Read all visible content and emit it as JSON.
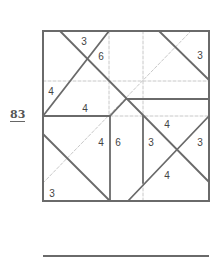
{
  "puzzle": {
    "number": "83",
    "frame": {
      "x1": 43,
      "y1": 31,
      "x2": 209,
      "y2": 201
    },
    "colors": {
      "solid": "#6a6a6a",
      "dashed": "#c8c8c8",
      "label": "#444444"
    },
    "solid_lines": [
      [
        60,
        31,
        209,
        182
      ],
      [
        109,
        31,
        43,
        116
      ],
      [
        159,
        31,
        209,
        80
      ],
      [
        126,
        99,
        209,
        99
      ],
      [
        43,
        116,
        110,
        116
      ],
      [
        110,
        116,
        126,
        99
      ],
      [
        110,
        116,
        110,
        201
      ],
      [
        143,
        116,
        143,
        183
      ],
      [
        128,
        201,
        209,
        116
      ],
      [
        43,
        134,
        110,
        201
      ]
    ],
    "dashed_lines": [
      [
        109,
        31,
        109,
        116
      ],
      [
        143,
        31,
        143,
        116
      ],
      [
        143,
        183,
        143,
        201
      ],
      [
        43,
        81,
        209,
        81
      ],
      [
        110,
        116,
        209,
        116
      ],
      [
        43,
        183,
        191,
        31
      ]
    ],
    "labels": [
      {
        "text": "3",
        "x": 84,
        "y": 45
      },
      {
        "text": "6",
        "x": 101,
        "y": 60
      },
      {
        "text": "3",
        "x": 200,
        "y": 59
      },
      {
        "text": "4",
        "x": 51,
        "y": 95
      },
      {
        "text": "4",
        "x": 85,
        "y": 112
      },
      {
        "text": "4",
        "x": 167,
        "y": 128
      },
      {
        "text": "4",
        "x": 101,
        "y": 146
      },
      {
        "text": "6",
        "x": 118,
        "y": 146
      },
      {
        "text": "3",
        "x": 151,
        "y": 146
      },
      {
        "text": "3",
        "x": 200,
        "y": 146
      },
      {
        "text": "4",
        "x": 167,
        "y": 179
      },
      {
        "text": "3",
        "x": 52,
        "y": 197
      }
    ]
  },
  "bottom_rule": {
    "x1": 43,
    "y1": 256,
    "x2": 209,
    "y2": 256
  }
}
